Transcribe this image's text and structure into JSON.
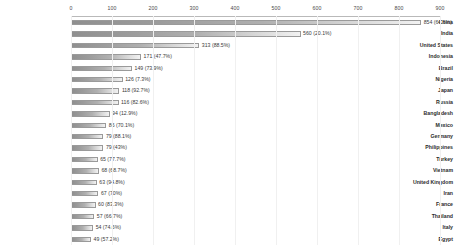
{
  "chart_data": {
    "type": "bar",
    "orientation": "horizontal",
    "title": "",
    "subtitle": "",
    "xlabel": "",
    "ylabel": "",
    "xlim": [
      0,
      900
    ],
    "grid": true,
    "legend": "none",
    "axis_position": "top",
    "tick_labels": [
      "0",
      "100",
      "200",
      "300",
      "400",
      "500",
      "600",
      "700",
      "800",
      "900"
    ],
    "tick_values": [
      0,
      100,
      200,
      300,
      400,
      500,
      600,
      700,
      800,
      900
    ],
    "categories": [
      "China",
      "India",
      "United States",
      "Indonesia",
      "Brazil",
      "Nigeria",
      "Japan",
      "Russia",
      "Bangladesh",
      "Mexico",
      "Germany",
      "Philippines",
      "Turkey",
      "Vietnam",
      "United Kingdom",
      "Iran",
      "France",
      "Thailand",
      "Italy",
      "Egypt"
    ],
    "values": [
      854,
      560,
      313,
      171,
      149,
      126,
      118,
      116,
      94,
      86,
      79,
      79,
      65,
      68,
      63,
      67,
      60,
      57,
      54,
      49
    ],
    "percents": [
      64.6,
      20.1,
      88.5,
      47.7,
      73.9,
      7.3,
      92.7,
      82.6,
      12.9,
      70.1,
      88.1,
      43.0,
      77.7,
      68.7,
      94.8,
      70.0,
      83.3,
      66.7,
      74.6,
      57.2
    ],
    "data_labels": [
      "854 (64.6%)",
      "560 (20.1%)",
      "313 (88.5%)",
      "171 (47.7%)",
      "149 (73.9%)",
      "126 (7.3%)",
      "118 (92.7%)",
      "116 (82.6%)",
      "94 (12.9%)",
      "86 (70.1%)",
      "79 (88.1%)",
      "79 (43%)",
      "65 (77.7%)",
      "68 (68.7%)",
      "63 (94.8%)",
      "67 (70%)",
      "60 (83.3%)",
      "57 (66.7%)",
      "54 (74.6%)",
      "49 (57.2%)"
    ],
    "colors": {
      "bar_start": "#8f8f8f",
      "bar_end": "#f2f2f2",
      "bar_border": "#9a9a9a",
      "label_text": "#2b2b2b",
      "value_text": "#3a3a3a",
      "axis_text": "#4a4a4a",
      "grid": "#f0f0f0",
      "axis_line": "#b9b9b9",
      "background": "#ffffff"
    }
  }
}
